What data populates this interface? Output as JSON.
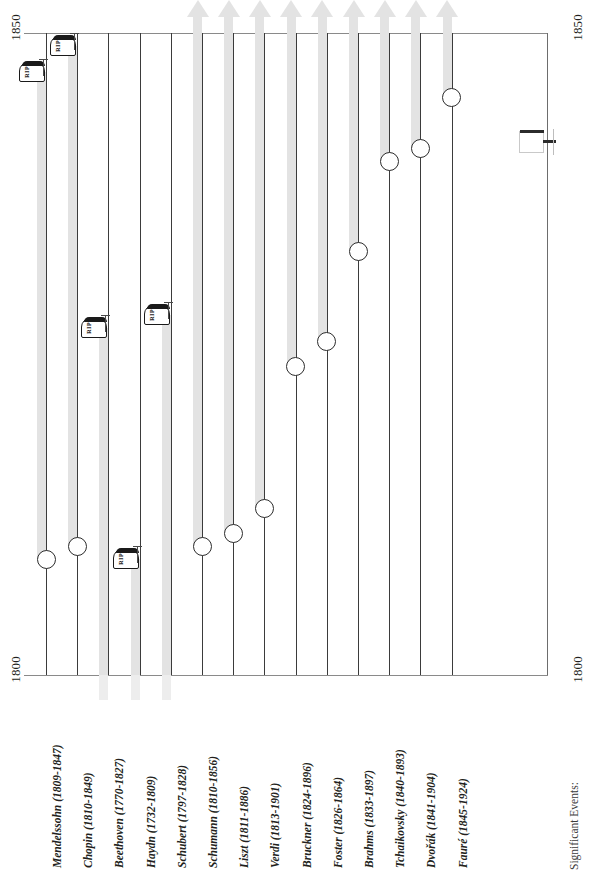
{
  "chart_data": {
    "type": "bar",
    "orientation": "vertical-timeline",
    "title": "",
    "xlabel": "",
    "ylabel": "",
    "ylim": [
      1800,
      1850
    ],
    "axis_ticks": [
      "1800",
      "1850"
    ],
    "grid": false,
    "legend": "none",
    "categories": [
      "Mendelssohn (1809-1847)",
      "Chopin (1810-1849)",
      "Beethoven (1770-1827)",
      "Haydn (1732-1809)",
      "Schubert (1797-1828)",
      "Schumann (1810-1856)",
      "Liszt (1811-1886)",
      "Verdi (1813-1901)",
      "Bruckner (1824-1896)",
      "Foster (1826-1864)",
      "Brahms (1833-1897)",
      "Tchaikovsky (1840-1893)",
      "Dvořák (1841-1904)",
      "Fauré (1845-1924)"
    ],
    "series": [
      {
        "name": "Lifespan",
        "points": [
          {
            "label": "Mendelssohn (1809-1847)",
            "name": "Mendelssohn",
            "birth": 1809,
            "death": 1847,
            "beyond_1850": false,
            "marker": "rip"
          },
          {
            "label": "Chopin (1810-1849)",
            "name": "Chopin",
            "birth": 1810,
            "death": 1849,
            "beyond_1850": false,
            "marker": "rip"
          },
          {
            "label": "Beethoven (1770-1827)",
            "name": "Beethoven",
            "birth": 1770,
            "death": 1827,
            "beyond_1850": false,
            "marker": "rip"
          },
          {
            "label": "Haydn (1732-1809)",
            "name": "Haydn",
            "birth": 1732,
            "death": 1809,
            "beyond_1850": false,
            "marker": "rip"
          },
          {
            "label": "Schubert (1797-1828)",
            "name": "Schubert",
            "birth": 1797,
            "death": 1828,
            "beyond_1850": false,
            "marker": "rip"
          },
          {
            "label": "Schumann (1810-1856)",
            "name": "Schumann",
            "birth": 1810,
            "death": 1856,
            "beyond_1850": true,
            "marker": "arrow"
          },
          {
            "label": "Liszt (1811-1886)",
            "name": "Liszt",
            "birth": 1811,
            "death": 1886,
            "beyond_1850": true,
            "marker": "arrow"
          },
          {
            "label": "Verdi (1813-1901)",
            "name": "Verdi",
            "birth": 1813,
            "death": 1901,
            "beyond_1850": true,
            "marker": "arrow"
          },
          {
            "label": "Bruckner (1824-1896)",
            "name": "Bruckner",
            "birth": 1824,
            "death": 1896,
            "beyond_1850": true,
            "marker": "arrow"
          },
          {
            "label": "Foster (1826-1864)",
            "name": "Foster",
            "birth": 1826,
            "death": 1864,
            "beyond_1850": true,
            "marker": "arrow"
          },
          {
            "label": "Brahms (1833-1897)",
            "name": "Brahms",
            "birth": 1833,
            "death": 1897,
            "beyond_1850": true,
            "marker": "arrow"
          },
          {
            "label": "Tchaikovsky (1840-1893)",
            "name": "Tchaikovsky",
            "birth": 1840,
            "death": 1893,
            "beyond_1850": true,
            "marker": "arrow"
          },
          {
            "label": "Dvořák (1841-1904)",
            "name": "Dvořák",
            "birth": 1841,
            "death": 1904,
            "beyond_1850": true,
            "marker": "arrow"
          },
          {
            "label": "Fauré (1845-1924)",
            "name": "Fauré",
            "birth": 1845,
            "death": 1924,
            "beyond_1850": true,
            "marker": "arrow"
          }
        ]
      }
    ]
  },
  "axis": {
    "top_left": "1850",
    "top_right": "1850",
    "bottom_left": "1800",
    "bottom_right": "1800"
  },
  "footer": {
    "events_label": "Significant Events:"
  },
  "markers": {
    "rip_text": "RIP"
  },
  "colors": {
    "bar": "#e3e3e3",
    "lane": "#3b3b3b",
    "axis": "#8a8a8a",
    "text": "#231f20"
  }
}
